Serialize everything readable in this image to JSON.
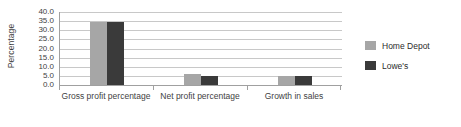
{
  "chart_data": {
    "type": "bar",
    "title": "",
    "subtitle": "",
    "xlabel": "",
    "ylabel": "Percentage",
    "ylim": [
      0.0,
      40.0
    ],
    "ytick_step": 5.0,
    "ytick_labels": [
      "40.0",
      "35.0",
      "30.0",
      "25.0",
      "20.0",
      "15.0",
      "10.0",
      "5.0",
      "0.0"
    ],
    "ytick_values": [
      40.0,
      35.0,
      30.0,
      25.0,
      20.0,
      15.0,
      10.0,
      5.0,
      0.0
    ],
    "grid": true,
    "grid_axis": "y",
    "legend_position": "right",
    "categories": [
      "Gross profit percentage",
      "Net profit percentage",
      "Growth in sales"
    ],
    "series": [
      {
        "name": "Home Depot",
        "color": "#a6a6a6",
        "values": [
          34.8,
          6.1,
          4.9
        ]
      },
      {
        "name": "Lowe's",
        "color": "#3a3a3a",
        "values": [
          34.8,
          4.8,
          5.0
        ]
      }
    ]
  },
  "colors": {
    "series_home_depot": "#a6a6a6",
    "series_lowes": "#3a3a3a",
    "gridline": "#c8c8c8",
    "axis": "#a0a0a0",
    "text": "#3f3f3f",
    "background": "#ffffff"
  },
  "axis": {
    "y_title": "Percentage"
  },
  "legend": {
    "entries": [
      {
        "label": "Home Depot",
        "swatch": "legend-swatch-home-depot"
      },
      {
        "label": "Lowe's",
        "swatch": "legend-swatch-lowes"
      }
    ]
  }
}
